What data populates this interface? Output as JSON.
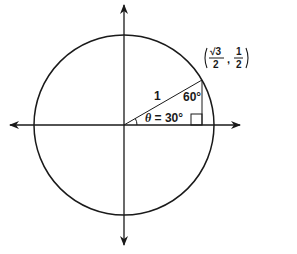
{
  "diagram": {
    "type": "unit-circle",
    "center": [
      124,
      125
    ],
    "radius_px": 90,
    "angle_deg": 30,
    "labels": {
      "hypotenuse": "1",
      "theta": "θ = 30°",
      "theta_symbol": "θ",
      "theta_value": " = 30°",
      "top_angle": "60°",
      "point_x_num": "√3",
      "point_x_den": "2",
      "point_y_num": "1",
      "point_y_den": "2",
      "point_sep": ","
    },
    "colors": {
      "stroke": "#1a1a1a",
      "background": "#ffffff"
    }
  }
}
